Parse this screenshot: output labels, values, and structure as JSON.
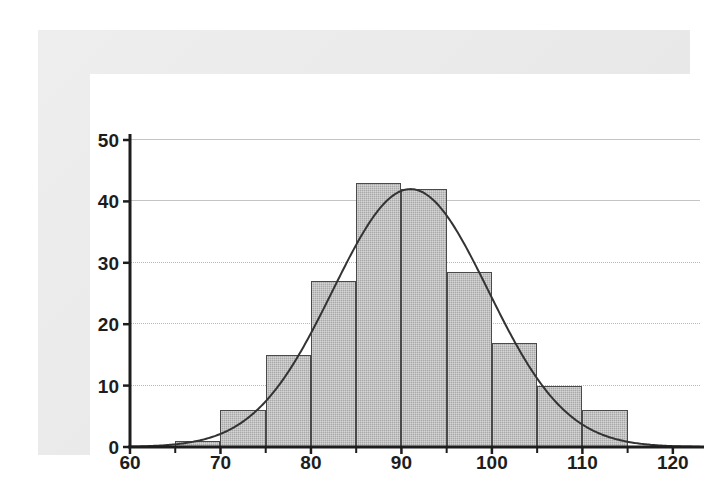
{
  "chart_data": {
    "type": "bar",
    "title": "",
    "subtitle": "",
    "xlabel": "",
    "ylabel": "",
    "xlim": [
      60,
      123
    ],
    "ylim": [
      0,
      50
    ],
    "grid": true,
    "legend": null,
    "bin_width": 5,
    "bins": [
      {
        "start": 60,
        "end": 65,
        "value": 0
      },
      {
        "start": 65,
        "end": 70,
        "value": 1
      },
      {
        "start": 70,
        "end": 75,
        "value": 6
      },
      {
        "start": 75,
        "end": 80,
        "value": 15
      },
      {
        "start": 80,
        "end": 85,
        "value": 27
      },
      {
        "start": 85,
        "end": 90,
        "value": 43
      },
      {
        "start": 90,
        "end": 95,
        "value": 42
      },
      {
        "start": 95,
        "end": 100,
        "value": 28.5
      },
      {
        "start": 100,
        "end": 105,
        "value": 17
      },
      {
        "start": 105,
        "end": 110,
        "value": 10
      },
      {
        "start": 110,
        "end": 115,
        "value": 6
      },
      {
        "start": 115,
        "end": 120,
        "value": 0
      }
    ],
    "categories": [
      "60-65",
      "65-70",
      "70-75",
      "75-80",
      "80-85",
      "85-90",
      "90-95",
      "95-100",
      "100-105",
      "105-110",
      "110-115",
      "115-120"
    ],
    "values": [
      0,
      1,
      6,
      15,
      27,
      43,
      42,
      28.5,
      17,
      10,
      6,
      0
    ],
    "overlay_curve": {
      "kind": "normal-density",
      "mean": 91,
      "sigma": 8.6,
      "peak": 42,
      "color": "#333333"
    },
    "x_ticks_labeled": [
      60,
      70,
      80,
      90,
      100,
      110,
      120
    ],
    "x_ticks_minor": [
      65,
      75,
      85,
      95,
      105,
      115
    ],
    "y_ticks": [
      0,
      10,
      20,
      30,
      40,
      50
    ],
    "colors": {
      "bar_fill": "#a8a8a8",
      "bar_edge": "#4a4a4a",
      "curve": "#333333",
      "grid": "#b9b9b9",
      "axis": "#1d1d1d",
      "panel_bg": "#ececec",
      "plot_bg": "#ffffff"
    }
  }
}
